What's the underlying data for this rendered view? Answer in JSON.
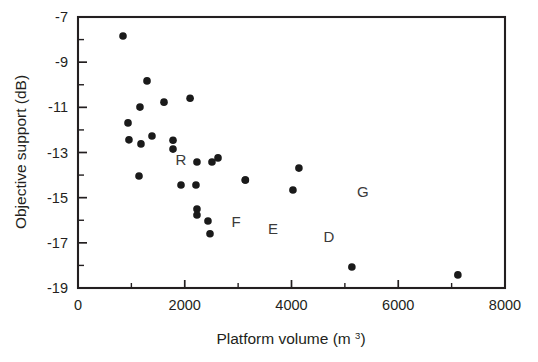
{
  "chart_data": {
    "type": "scatter",
    "title": "",
    "xlabel": "Platform volume (m³)",
    "xlabel_text": "Platform volume (m ",
    "xlabel_sup": "3",
    "xlabel_tail": ")",
    "ylabel": "Objective support (dB)",
    "xlim": [
      0,
      8000
    ],
    "ylim": [
      -19,
      -7
    ],
    "x_ticks": [
      0,
      2000,
      4000,
      6000,
      8000
    ],
    "x_tick_labels": [
      "0",
      "2000",
      "4000",
      "6000",
      "8000"
    ],
    "x_minor_step": 1000,
    "y_ticks": [
      -7,
      -9,
      -11,
      -13,
      -15,
      -17,
      -19
    ],
    "y_tick_labels": [
      "-7",
      "-9",
      "-11",
      "-13",
      "-15",
      "-17",
      "-19"
    ],
    "y_minor_step": 1,
    "grid": false,
    "legend": "none",
    "marker": "filled-circle",
    "marker_color": "#1a1a1a",
    "marker_size_px": 7.6,
    "points": [
      {
        "x": 843,
        "y": -7.84
      },
      {
        "x": 1293,
        "y": -9.83
      },
      {
        "x": 1161,
        "y": -10.99
      },
      {
        "x": 1611,
        "y": -10.77
      },
      {
        "x": 2100,
        "y": -10.6
      },
      {
        "x": 937,
        "y": -11.69
      },
      {
        "x": 1386,
        "y": -12.27
      },
      {
        "x": 955,
        "y": -12.44
      },
      {
        "x": 1180,
        "y": -12.62
      },
      {
        "x": 1780,
        "y": -12.46
      },
      {
        "x": 1780,
        "y": -12.85
      },
      {
        "x": 2229,
        "y": -13.42
      },
      {
        "x": 2510,
        "y": -13.42
      },
      {
        "x": 2623,
        "y": -13.24
      },
      {
        "x": 1143,
        "y": -14.04
      },
      {
        "x": 2210,
        "y": -14.44
      },
      {
        "x": 1930,
        "y": -14.44
      },
      {
        "x": 3135,
        "y": -14.22
      },
      {
        "x": 3135,
        "y": -14.22
      },
      {
        "x": 2229,
        "y": -15.5
      },
      {
        "x": 2229,
        "y": -15.77
      },
      {
        "x": 2435,
        "y": -16.03
      },
      {
        "x": 2473,
        "y": -16.6
      },
      {
        "x": 4139,
        "y": -13.69
      },
      {
        "x": 4027,
        "y": -14.66
      },
      {
        "x": 5131,
        "y": -18.07
      },
      {
        "x": 7117,
        "y": -18.42
      }
    ],
    "annotations": [
      {
        "label": "R",
        "x": 1930,
        "y": -13.33
      },
      {
        "label": "F",
        "x": 2960,
        "y": -16.07
      },
      {
        "label": "E",
        "x": 3654,
        "y": -16.38
      },
      {
        "label": "D",
        "x": 4702,
        "y": -16.73
      },
      {
        "label": "G",
        "x": 5338,
        "y": -14.74
      }
    ]
  }
}
